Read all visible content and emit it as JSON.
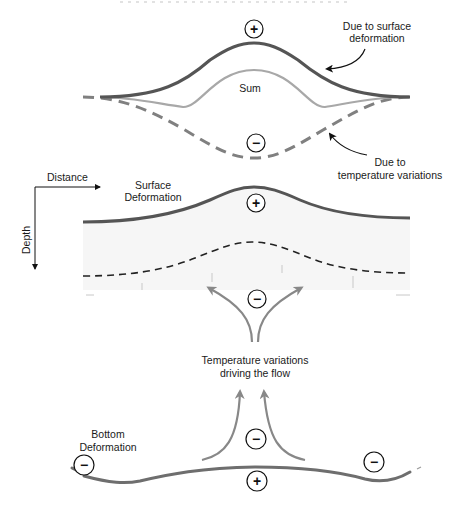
{
  "top_panel": {
    "label_surface": [
      "Due to surface",
      "deformation"
    ],
    "label_sum": "Sum",
    "label_temperature": [
      "Due to",
      "temperature variations"
    ],
    "sign_top": "+",
    "sign_bottom": "−",
    "colors": {
      "surface_curve": "#555555",
      "sum_curve": "#a8a8a8",
      "temperature_curve": "#808080"
    }
  },
  "middle_panel": {
    "axis_x_label": "Distance",
    "axis_y_label": "Depth",
    "surface_label": [
      "Surface",
      "Deformation"
    ],
    "sign_surface": "+",
    "sign_flow": "−",
    "colors": {
      "surface_line": "#555555",
      "dashed_line": "#222222",
      "fill": "#f6f6f6",
      "arrows": "#888888"
    }
  },
  "center_label": [
    "Temperature variations",
    "driving the flow"
  ],
  "bottom_panel": {
    "bottom_label": [
      "Bottom",
      "Deformation"
    ],
    "sign_left": "−",
    "sign_center": "−",
    "sign_right": "−",
    "sign_bottom": "+",
    "colors": {
      "bottom_line": "#6e6e6e",
      "arrows": "#888888"
    }
  }
}
